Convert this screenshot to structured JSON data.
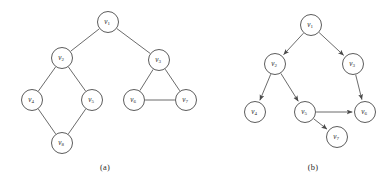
{
  "figure": {
    "background_color": "#ffffff",
    "stroke_color": "#5a5a5a",
    "node_fill": "#ffffff",
    "label_color": "#2b2b2b",
    "node_radius": 10.5,
    "panels": [
      {
        "id": "panel-a",
        "caption": "(a)",
        "caption_x": 105,
        "caption_y": 168,
        "graph_type": "undirected",
        "nodes": [
          {
            "id": "v1",
            "base": "v",
            "sub": "1",
            "x": 108,
            "y": 22
          },
          {
            "id": "v2",
            "base": "v",
            "sub": "2",
            "x": 62,
            "y": 58
          },
          {
            "id": "v3",
            "base": "v",
            "sub": "3",
            "x": 159,
            "y": 60
          },
          {
            "id": "v4",
            "base": "v",
            "sub": "4",
            "x": 32,
            "y": 100
          },
          {
            "id": "v5",
            "base": "v",
            "sub": "5",
            "x": 92,
            "y": 100
          },
          {
            "id": "v6",
            "base": "v",
            "sub": "6",
            "x": 134,
            "y": 100
          },
          {
            "id": "v7",
            "base": "v",
            "sub": "7",
            "x": 186,
            "y": 100
          },
          {
            "id": "v8",
            "base": "v",
            "sub": "8",
            "x": 62,
            "y": 143
          }
        ],
        "edges": [
          {
            "from": "v1",
            "to": "v2"
          },
          {
            "from": "v1",
            "to": "v3"
          },
          {
            "from": "v2",
            "to": "v4"
          },
          {
            "from": "v2",
            "to": "v5"
          },
          {
            "from": "v4",
            "to": "v8"
          },
          {
            "from": "v5",
            "to": "v8"
          },
          {
            "from": "v3",
            "to": "v6"
          },
          {
            "from": "v3",
            "to": "v7"
          },
          {
            "from": "v6",
            "to": "v7"
          }
        ]
      },
      {
        "id": "panel-b",
        "caption": "(b)",
        "caption_x": 313,
        "caption_y": 168,
        "graph_type": "directed",
        "nodes": [
          {
            "id": "v1",
            "base": "v",
            "sub": "1",
            "x": 311,
            "y": 25
          },
          {
            "id": "v2",
            "base": "v",
            "sub": "2",
            "x": 275,
            "y": 64
          },
          {
            "id": "v3",
            "base": "v",
            "sub": "3",
            "x": 353,
            "y": 64
          },
          {
            "id": "v4",
            "base": "v",
            "sub": "4",
            "x": 255,
            "y": 112
          },
          {
            "id": "v5",
            "base": "v",
            "sub": "5",
            "x": 305,
            "y": 112
          },
          {
            "id": "v6",
            "base": "v",
            "sub": "6",
            "x": 365,
            "y": 112
          },
          {
            "id": "v7",
            "base": "v",
            "sub": "7",
            "x": 337,
            "y": 137
          }
        ],
        "edges": [
          {
            "from": "v1",
            "to": "v2"
          },
          {
            "from": "v1",
            "to": "v3"
          },
          {
            "from": "v2",
            "to": "v4"
          },
          {
            "from": "v2",
            "to": "v5"
          },
          {
            "from": "v3",
            "to": "v6"
          },
          {
            "from": "v5",
            "to": "v6"
          },
          {
            "from": "v5",
            "to": "v7"
          }
        ]
      }
    ]
  }
}
